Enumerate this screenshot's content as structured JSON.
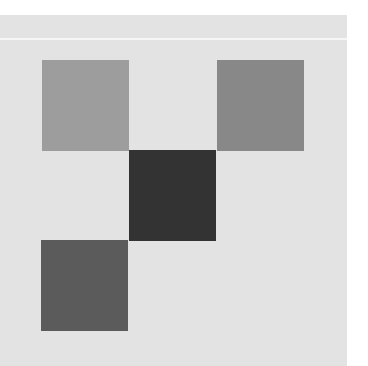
{
  "canvas": {
    "background": "#ffffff",
    "panel_color": "#e3e3e3",
    "divider_color": "#f6f6f6"
  },
  "squares": [
    {
      "name": "top-left-square",
      "left": 42,
      "top": 60,
      "color": "#9d9d9d"
    },
    {
      "name": "top-right-square",
      "left": 217,
      "top": 60,
      "color": "#888888"
    },
    {
      "name": "center-square",
      "left": 129,
      "top": 150,
      "color": "#333333"
    },
    {
      "name": "bottom-left-square",
      "left": 41,
      "top": 240,
      "color": "#5b5b5b"
    }
  ]
}
